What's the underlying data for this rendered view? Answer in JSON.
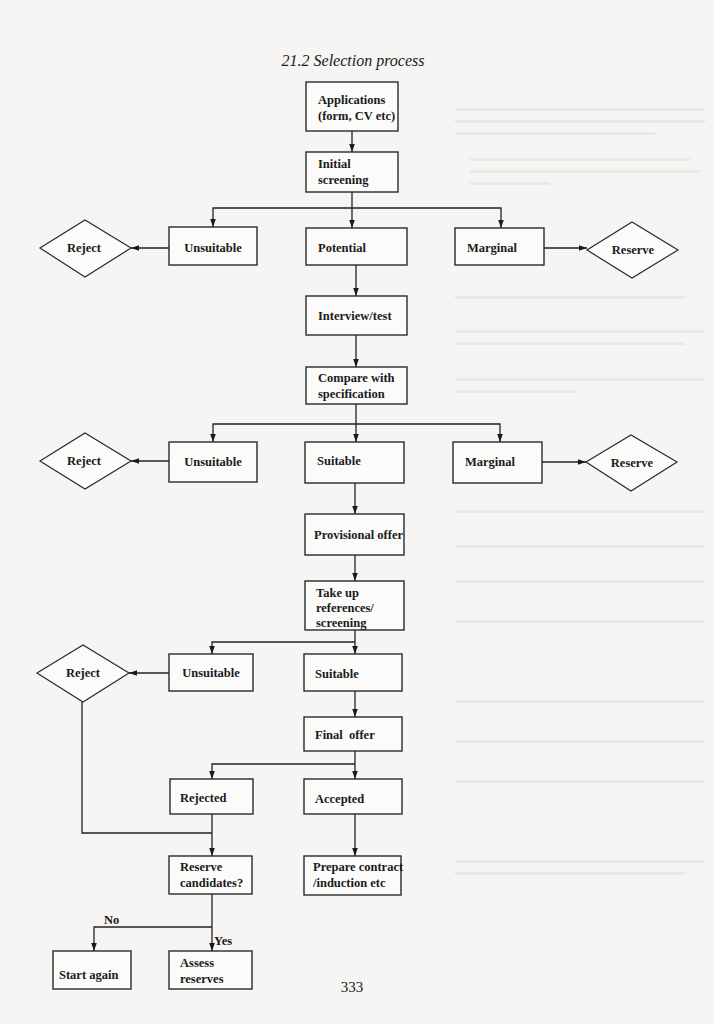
{
  "figure": {
    "title": "21.2 Selection process",
    "page_number": "333"
  },
  "nodes": {
    "applications": [
      "Applications",
      "(form, CV etc)"
    ],
    "initial_screening": [
      "Initial",
      "screening"
    ],
    "unsuitable_1": "Unsuitable",
    "potential": "Potential",
    "marginal_1": "Marginal",
    "reject_1": "Reject",
    "reserve_1": "Reserve",
    "interview_test": "Interview/test",
    "compare": [
      "Compare with",
      "specification"
    ],
    "unsuitable_2": "Unsuitable",
    "suitable_2": "Suitable",
    "marginal_2": "Marginal",
    "reject_2": "Reject",
    "reserve_2": "Reserve",
    "provisional_offer": "Provisional offer",
    "take_up": [
      "Take up",
      "references/",
      "screening"
    ],
    "unsuitable_3": "Unsuitable",
    "suitable_3": "Suitable",
    "reject_3": "Reject",
    "final_offer": "Final  offer",
    "rejected": "Rejected",
    "accepted": "Accepted",
    "reserve_candidates": [
      "Reserve",
      "candidates?"
    ],
    "prepare_contract": [
      "Prepare contract",
      "/induction etc"
    ],
    "start_again": "Start again",
    "assess_reserves": [
      "Assess",
      "reserves"
    ]
  },
  "edge_labels": {
    "no": "No",
    "yes": "Yes"
  },
  "edges": [
    [
      "Applications",
      "Initial screening"
    ],
    [
      "Initial screening",
      "Unsuitable"
    ],
    [
      "Initial screening",
      "Potential"
    ],
    [
      "Initial screening",
      "Marginal"
    ],
    [
      "Unsuitable",
      "Reject"
    ],
    [
      "Marginal",
      "Reserve"
    ],
    [
      "Potential",
      "Interview/test"
    ],
    [
      "Interview/test",
      "Compare with specification"
    ],
    [
      "Compare with specification",
      "Unsuitable"
    ],
    [
      "Compare with specification",
      "Suitable"
    ],
    [
      "Compare with specification",
      "Marginal"
    ],
    [
      "Unsuitable",
      "Reject"
    ],
    [
      "Marginal",
      "Reserve"
    ],
    [
      "Suitable",
      "Provisional offer"
    ],
    [
      "Provisional offer",
      "Take up references/screening"
    ],
    [
      "Take up references/screening",
      "Unsuitable"
    ],
    [
      "Take up references/screening",
      "Suitable"
    ],
    [
      "Unsuitable",
      "Reject"
    ],
    [
      "Suitable",
      "Final offer"
    ],
    [
      "Final offer",
      "Rejected"
    ],
    [
      "Final offer",
      "Accepted"
    ],
    [
      "Reject",
      "Reserve candidates?"
    ],
    [
      "Rejected",
      "Reserve candidates?"
    ],
    [
      "Accepted",
      "Prepare contract/induction etc"
    ],
    [
      "Reserve candidates?",
      "Start again",
      "No"
    ],
    [
      "Reserve candidates?",
      "Assess reserves",
      "Yes"
    ]
  ],
  "colors": {
    "ink": "#1a1a1a",
    "paper": "#f6f5f3"
  }
}
